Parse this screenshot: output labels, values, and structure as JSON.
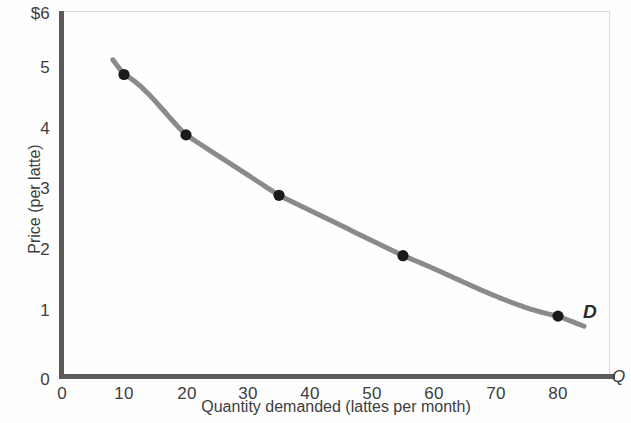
{
  "chart_data": {
    "type": "line",
    "title": "",
    "subtitle": "",
    "xlabel": "Quantity demanded (lattes per month)",
    "ylabel": "Price (per latte)",
    "x_axis_letter": "Q",
    "xlim": [
      0,
      89
    ],
    "ylim": [
      0,
      6
    ],
    "grid": false,
    "legend_position": "inline-right",
    "series": [
      {
        "name": "D",
        "label": "D",
        "color": "#8a8a8a",
        "marker_color": "#1a1a1a",
        "x": [
          10,
          20,
          35,
          55,
          80
        ],
        "values": [
          5,
          4,
          3,
          2,
          1
        ]
      }
    ],
    "points": [
      {
        "quantity": 10,
        "price": 5
      },
      {
        "quantity": 20,
        "price": 4
      },
      {
        "quantity": 35,
        "price": 3
      },
      {
        "quantity": 55,
        "price": 2
      },
      {
        "quantity": 80,
        "price": 1
      }
    ],
    "ytick_labels": [
      "$6",
      "5",
      "4",
      "3",
      "2",
      "1",
      "0"
    ],
    "ytick_values": [
      6,
      5,
      4,
      3,
      2,
      1,
      0
    ],
    "xtick_labels": [
      "0",
      "10",
      "20",
      "30",
      "40",
      "50",
      "60",
      "70",
      "80"
    ],
    "xtick_values": [
      0,
      10,
      20,
      30,
      40,
      50,
      60,
      70,
      80
    ],
    "annotations": [
      {
        "text": "D",
        "x": 85,
        "y": 1.1,
        "style": "bold-italic"
      }
    ]
  },
  "colors": {
    "curve": "#8a8a8a",
    "marker": "#1a1a1a",
    "axis": "#5b5b5b",
    "text": "#3d3d3d",
    "frame": "#dcdcdc",
    "background": "#fefefe"
  }
}
